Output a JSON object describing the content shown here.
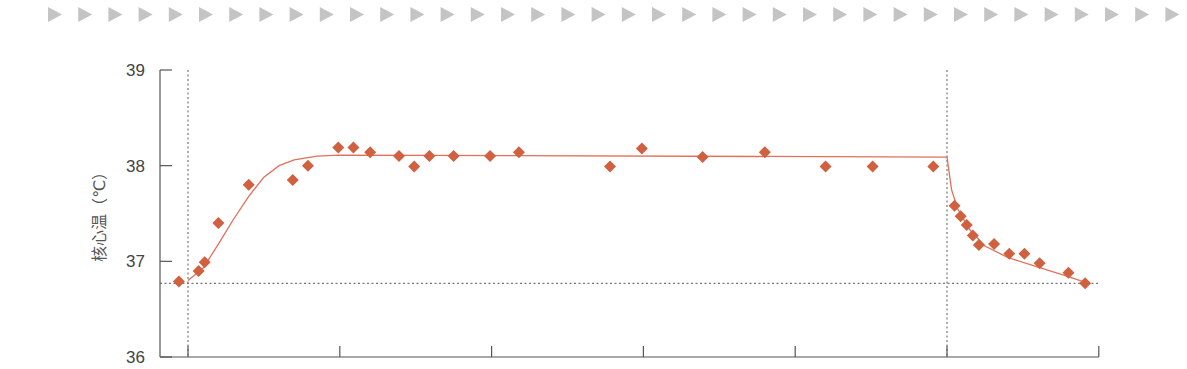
{
  "header": {
    "decoration": "row-of-gray-triangles",
    "triangle_count": 38,
    "triangle_color": "#c4c4c4"
  },
  "colors": {
    "marker": "#d0603f",
    "curve": "#e0705a",
    "axis": "#555555",
    "reference_line": "#777777"
  },
  "chart_data": {
    "type": "scatter",
    "title": "",
    "xlabel": "",
    "ylabel": "核心温（℃）",
    "ylim": [
      36,
      39
    ],
    "yticks": [
      36,
      37,
      38,
      39
    ],
    "ytick_labels": [
      "36",
      "37",
      "38",
      "39"
    ],
    "xlim": [
      -0.18,
      6.0
    ],
    "xticks": [
      0,
      1,
      2,
      3,
      4,
      5,
      6
    ],
    "xtick_labels": [
      "",
      "",
      "",
      "",
      "",
      "",
      ""
    ],
    "grid": false,
    "legend": null,
    "reference_lines": {
      "horizontal_y": 36.77,
      "vertical_x": [
        0,
        5
      ]
    },
    "series": [
      {
        "name": "measured",
        "kind": "scatter",
        "marker": "diamond",
        "points": [
          {
            "x": -0.06,
            "y": 36.79
          },
          {
            "x": 0.07,
            "y": 36.9
          },
          {
            "x": 0.11,
            "y": 36.99
          },
          {
            "x": 0.2,
            "y": 37.4
          },
          {
            "x": 0.4,
            "y": 37.8
          },
          {
            "x": 0.69,
            "y": 37.85
          },
          {
            "x": 0.79,
            "y": 38.0
          },
          {
            "x": 0.99,
            "y": 38.19
          },
          {
            "x": 1.09,
            "y": 38.19
          },
          {
            "x": 1.2,
            "y": 38.14
          },
          {
            "x": 1.39,
            "y": 38.1
          },
          {
            "x": 1.49,
            "y": 37.99
          },
          {
            "x": 1.59,
            "y": 38.1
          },
          {
            "x": 1.75,
            "y": 38.1
          },
          {
            "x": 1.99,
            "y": 38.1
          },
          {
            "x": 2.18,
            "y": 38.14
          },
          {
            "x": 2.78,
            "y": 37.99
          },
          {
            "x": 2.99,
            "y": 38.18
          },
          {
            "x": 3.39,
            "y": 38.09
          },
          {
            "x": 3.8,
            "y": 38.14
          },
          {
            "x": 4.2,
            "y": 37.99
          },
          {
            "x": 4.51,
            "y": 37.99
          },
          {
            "x": 4.91,
            "y": 37.99
          },
          {
            "x": 5.05,
            "y": 37.58
          },
          {
            "x": 5.09,
            "y": 37.47
          },
          {
            "x": 5.13,
            "y": 37.38
          },
          {
            "x": 5.17,
            "y": 37.27
          },
          {
            "x": 5.21,
            "y": 37.17
          },
          {
            "x": 5.31,
            "y": 37.18
          },
          {
            "x": 5.41,
            "y": 37.08
          },
          {
            "x": 5.51,
            "y": 37.08
          },
          {
            "x": 5.61,
            "y": 36.98
          },
          {
            "x": 5.8,
            "y": 36.88
          },
          {
            "x": 5.91,
            "y": 36.77
          }
        ]
      },
      {
        "name": "fit",
        "kind": "line",
        "points": [
          {
            "x": 0.0,
            "y": 36.8
          },
          {
            "x": 0.1,
            "y": 36.93
          },
          {
            "x": 0.2,
            "y": 37.18
          },
          {
            "x": 0.3,
            "y": 37.44
          },
          {
            "x": 0.4,
            "y": 37.68
          },
          {
            "x": 0.5,
            "y": 37.88
          },
          {
            "x": 0.6,
            "y": 38.0
          },
          {
            "x": 0.7,
            "y": 38.06
          },
          {
            "x": 0.85,
            "y": 38.1
          },
          {
            "x": 1.0,
            "y": 38.11
          },
          {
            "x": 5.0,
            "y": 38.09
          },
          {
            "x": 5.03,
            "y": 37.75
          },
          {
            "x": 5.07,
            "y": 37.55
          },
          {
            "x": 5.15,
            "y": 37.33
          },
          {
            "x": 5.25,
            "y": 37.16
          },
          {
            "x": 5.4,
            "y": 37.04
          },
          {
            "x": 5.6,
            "y": 36.94
          },
          {
            "x": 5.8,
            "y": 36.84
          },
          {
            "x": 5.91,
            "y": 36.78
          }
        ]
      }
    ]
  }
}
